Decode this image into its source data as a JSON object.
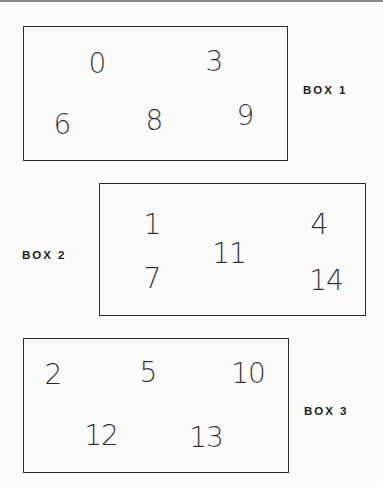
{
  "boxes": [
    {
      "label": "BOX 1",
      "rect": {
        "left": 23,
        "top": 26,
        "width": 265,
        "height": 135
      },
      "label_pos": {
        "left": 303,
        "top": 90
      },
      "numbers": [
        {
          "value": "0",
          "x": 97,
          "y": 64
        },
        {
          "value": "3",
          "x": 214,
          "y": 62
        },
        {
          "value": "6",
          "x": 62,
          "y": 125
        },
        {
          "value": "8",
          "x": 154,
          "y": 121
        },
        {
          "value": "9",
          "x": 245,
          "y": 116
        }
      ]
    },
    {
      "label": "BOX 2",
      "rect": {
        "left": 99,
        "top": 183,
        "width": 267,
        "height": 133
      },
      "label_pos": {
        "left": 22,
        "top": 255
      },
      "numbers": [
        {
          "value": "1",
          "x": 152,
          "y": 225
        },
        {
          "value": "4",
          "x": 319,
          "y": 225
        },
        {
          "value": "11",
          "x": 229,
          "y": 254
        },
        {
          "value": "7",
          "x": 152,
          "y": 279
        },
        {
          "value": "14",
          "x": 326,
          "y": 281
        }
      ]
    },
    {
      "label": "BOX 3",
      "rect": {
        "left": 23,
        "top": 338,
        "width": 266,
        "height": 135
      },
      "label_pos": {
        "left": 304,
        "top": 411
      },
      "numbers": [
        {
          "value": "2",
          "x": 53,
          "y": 375
        },
        {
          "value": "5",
          "x": 148,
          "y": 373
        },
        {
          "value": "10",
          "x": 248,
          "y": 374
        },
        {
          "value": "12",
          "x": 101,
          "y": 436
        },
        {
          "value": "13",
          "x": 206,
          "y": 438
        }
      ]
    }
  ]
}
